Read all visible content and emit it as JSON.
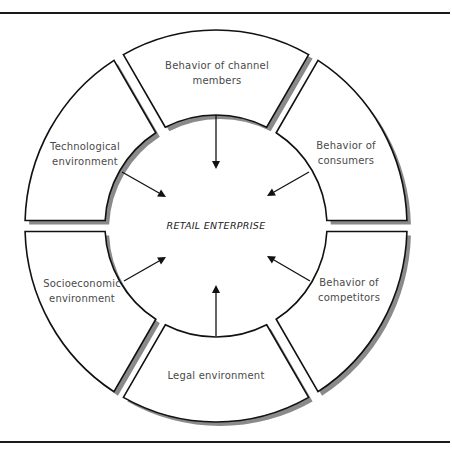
{
  "diagram": {
    "center_label": "RETAIL ENTERPRISE",
    "geometry": {
      "cx": 216,
      "cy": 226,
      "outer_rx": 191,
      "outer_ry": 196,
      "inner_r": 111,
      "gap_half": 5.5,
      "shadow_dx": 4,
      "shadow_dy": 4
    },
    "colors": {
      "stroke": "#111111",
      "shadow": "#8a8a8a",
      "fill": "#ffffff",
      "label": "#4a4a4a"
    },
    "segments": [
      {
        "id": "channel-members",
        "lines": [
          "Behavior of channel",
          "members"
        ],
        "start_deg": -120,
        "end_deg": -60,
        "label_x": 217,
        "label_y": 69,
        "arrow": {
          "x1": 216,
          "y1": 115,
          "x2": 216,
          "y2": 169
        }
      },
      {
        "id": "consumers",
        "lines": [
          "Behavior of",
          "consumers"
        ],
        "start_deg": -60,
        "end_deg": 0,
        "label_x": 346,
        "label_y": 149,
        "arrow": {
          "x1": 309,
          "y1": 172,
          "x2": 267,
          "y2": 196
        }
      },
      {
        "id": "competitors",
        "lines": [
          "Behavior of",
          "competitors"
        ],
        "start_deg": 0,
        "end_deg": 60,
        "label_x": 349,
        "label_y": 286,
        "arrow": {
          "x1": 310,
          "y1": 281,
          "x2": 267,
          "y2": 256
        }
      },
      {
        "id": "legal",
        "lines": [
          "Legal environment"
        ],
        "start_deg": 60,
        "end_deg": 120,
        "label_x": 216,
        "label_y": 379,
        "arrow": {
          "x1": 216,
          "y1": 336,
          "x2": 216,
          "y2": 285
        }
      },
      {
        "id": "socioeconomic",
        "lines": [
          "Socioeconomic",
          "environment"
        ],
        "start_deg": 120,
        "end_deg": 180,
        "label_x": 82,
        "label_y": 287,
        "arrow": {
          "x1": 124,
          "y1": 281,
          "x2": 166,
          "y2": 257
        }
      },
      {
        "id": "technological",
        "lines": [
          "Technological",
          "environment"
        ],
        "start_deg": 180,
        "end_deg": 240,
        "label_x": 85,
        "label_y": 150,
        "arrow": {
          "x1": 122,
          "y1": 172,
          "x2": 166,
          "y2": 197
        }
      }
    ]
  }
}
